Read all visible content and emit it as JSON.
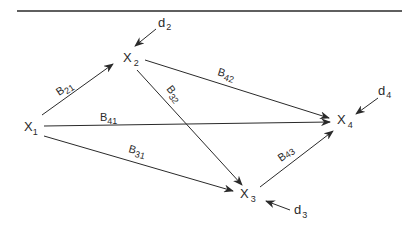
{
  "diagram": {
    "type": "path-diagram",
    "colors": {
      "ink": "#2a2a2a",
      "background": "#ffffff"
    },
    "nodes": [
      {
        "id": "X1",
        "base": "X",
        "sub": "1"
      },
      {
        "id": "X2",
        "base": "X",
        "sub": "2"
      },
      {
        "id": "X3",
        "base": "X",
        "sub": "3"
      },
      {
        "id": "X4",
        "base": "X",
        "sub": "4"
      }
    ],
    "disturbances": [
      {
        "id": "d2",
        "base": "d",
        "sub": "2",
        "target": "X2"
      },
      {
        "id": "d3",
        "base": "d",
        "sub": "3",
        "target": "X3"
      },
      {
        "id": "d4",
        "base": "d",
        "sub": "4",
        "target": "X4"
      }
    ],
    "paths": [
      {
        "id": "B21",
        "base": "B",
        "sub": "21",
        "from": "X1",
        "to": "X2"
      },
      {
        "id": "B41",
        "base": "B",
        "sub": "41",
        "from": "X1",
        "to": "X4"
      },
      {
        "id": "B31",
        "base": "B",
        "sub": "31",
        "from": "X1",
        "to": "X3"
      },
      {
        "id": "B42",
        "base": "B",
        "sub": "42",
        "from": "X2",
        "to": "X4"
      },
      {
        "id": "B32",
        "base": "B",
        "sub": "32",
        "from": "X2",
        "to": "X3"
      },
      {
        "id": "B43",
        "base": "B",
        "sub": "43",
        "from": "X3",
        "to": "X4"
      }
    ]
  }
}
